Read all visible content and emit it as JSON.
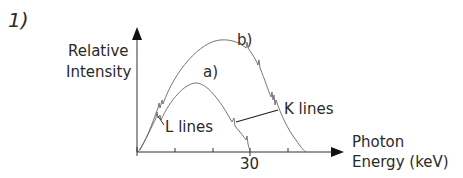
{
  "figure": {
    "number": "1)",
    "y_axis_label_line1": "Relative",
    "y_axis_label_line2": "Intensity",
    "x_axis_label_line1": "Photon",
    "x_axis_label_line2": "Energy (keV)",
    "x_tick_label": "30",
    "curve_a_label": "a)",
    "curve_b_label": "b)",
    "annotation_l_lines": "L lines",
    "annotation_k_lines": "K lines"
  }
}
